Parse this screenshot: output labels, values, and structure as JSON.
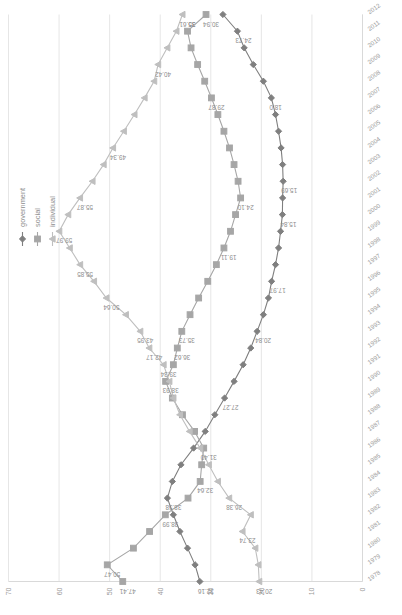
{
  "chart_data": {
    "type": "line",
    "title": "",
    "subtitle": "",
    "xlabel": "",
    "ylabel": "",
    "orientation": "rotated-90",
    "grid": true,
    "legend_position": "top-right",
    "ylim": [
      0,
      70
    ],
    "yticks": [
      70,
      60,
      50,
      40,
      30,
      20,
      10,
      0
    ],
    "x": [
      "1978",
      "1979",
      "1980",
      "1981",
      "1982",
      "1983",
      "1984",
      "1985",
      "1986",
      "1987",
      "1988",
      "1989",
      "1990",
      "1991",
      "1992",
      "1993",
      "1994",
      "1995",
      "1996",
      "1997",
      "1998",
      "1999",
      "2000",
      "2001",
      "2002",
      "2003",
      "2004",
      "2005",
      "2006",
      "2007",
      "2008",
      "2009",
      "2010",
      "2011",
      "2012"
    ],
    "series": [
      {
        "name": "government",
        "color": "#7f7f7f",
        "marker": "diamond",
        "values": [
          32.16,
          33.1,
          34.6,
          36.1,
          37.4,
          38.58,
          37.6,
          35.9,
          33.4,
          31.1,
          29.2,
          27.27,
          25.4,
          23.6,
          22.1,
          20.84,
          19.6,
          18.6,
          17.97,
          17.2,
          16.6,
          16.2,
          15.84,
          15.8,
          15.69,
          15.8,
          16.1,
          16.6,
          17.2,
          18.02,
          19.6,
          21.6,
          23.4,
          24.73,
          27.6
        ]
      },
      {
        "name": "social",
        "color": "#a6a6a6",
        "marker": "square",
        "values": [
          47.41,
          50.47,
          45.3,
          42.1,
          38.99,
          34.5,
          32.1,
          31.8,
          31.4,
          33.2,
          35.6,
          37.6,
          38.93,
          37.4,
          36.62,
          35.73,
          34.1,
          32.4,
          30.6,
          28.9,
          27.4,
          26.1,
          25.1,
          24.1,
          24.6,
          25.4,
          26.3,
          27.4,
          28.6,
          29.87,
          31.2,
          32.6,
          33.9,
          34.6,
          30.94
        ]
      },
      {
        "name": "individual",
        "color": "#bfbfbf",
        "marker": "triangle",
        "values": [
          20.43,
          20.6,
          21.2,
          23.74,
          22.1,
          26.38,
          28.6,
          30.4,
          32.1,
          34.2,
          36.1,
          37.4,
          38.2,
          39.34,
          42.17,
          43.95,
          46.8,
          50.64,
          53.1,
          55.85,
          57.9,
          59.97,
          58.2,
          55.87,
          53.4,
          51.2,
          49.34,
          47.2,
          45.1,
          43.1,
          41.2,
          40.42,
          38.6,
          36.8,
          35.61
        ]
      }
    ],
    "data_labels": [
      {
        "series": "social",
        "year": "1978",
        "value": "47.41"
      },
      {
        "series": "social",
        "year": "1979",
        "value": "50.47"
      },
      {
        "series": "social",
        "year": "1982",
        "value": "38.99"
      },
      {
        "series": "social",
        "year": "1984",
        "value": "32.64"
      },
      {
        "series": "social",
        "year": "1986",
        "value": "31.40"
      },
      {
        "series": "social",
        "year": "1990",
        "value": "38.93"
      },
      {
        "series": "social",
        "year": "1992",
        "value": "36.62"
      },
      {
        "series": "social",
        "year": "1993",
        "value": "35.73"
      },
      {
        "series": "social",
        "year": "2001",
        "value": "24.10"
      },
      {
        "series": "social",
        "year": "1998",
        "value": "19.11"
      },
      {
        "series": "social",
        "year": "2007",
        "value": "29.87"
      },
      {
        "series": "social",
        "year": "2012",
        "value": "30.94"
      },
      {
        "series": "government",
        "year": "1978",
        "value": "32.16"
      },
      {
        "series": "government",
        "year": "1983",
        "value": "38.58"
      },
      {
        "series": "government",
        "year": "1989",
        "value": "27.27"
      },
      {
        "series": "government",
        "year": "1993",
        "value": "20.84"
      },
      {
        "series": "government",
        "year": "1996",
        "value": "17.97"
      },
      {
        "series": "government",
        "year": "2000",
        "value": "15.84"
      },
      {
        "series": "government",
        "year": "2002",
        "value": "15.69"
      },
      {
        "series": "government",
        "year": "2007",
        "value": "18.0"
      },
      {
        "series": "government",
        "year": "2011",
        "value": "24.73"
      },
      {
        "series": "individual",
        "year": "1978",
        "value": "20.43"
      },
      {
        "series": "individual",
        "year": "1981",
        "value": "23.74"
      },
      {
        "series": "individual",
        "year": "1983",
        "value": "26.38"
      },
      {
        "series": "individual",
        "year": "1991",
        "value": "39.34"
      },
      {
        "series": "individual",
        "year": "1992",
        "value": "42.17"
      },
      {
        "series": "individual",
        "year": "1993",
        "value": "43.95"
      },
      {
        "series": "individual",
        "year": "1995",
        "value": "50.64"
      },
      {
        "series": "individual",
        "year": "1997",
        "value": "55.85"
      },
      {
        "series": "individual",
        "year": "1999",
        "value": "59.97"
      },
      {
        "series": "individual",
        "year": "2001",
        "value": "55.87"
      },
      {
        "series": "individual",
        "year": "2004",
        "value": "49.34"
      },
      {
        "series": "individual",
        "year": "2009",
        "value": "40.42"
      },
      {
        "series": "individual",
        "year": "2012",
        "value": "35.61"
      },
      {
        "series": "individual",
        "year": "2012b",
        "value": "35"
      }
    ]
  },
  "legend": {
    "items": [
      {
        "label": "government"
      },
      {
        "label": "social"
      },
      {
        "label": "individual"
      }
    ]
  }
}
